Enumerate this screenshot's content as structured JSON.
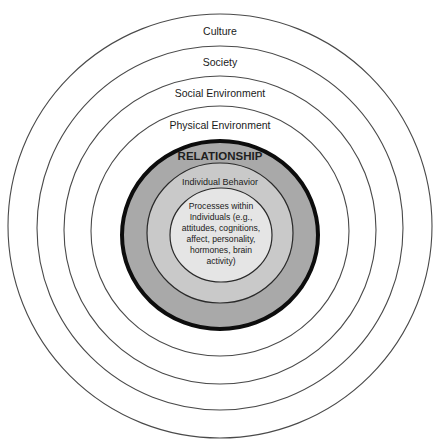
{
  "diagram": {
    "title": "",
    "type": "nested-concentric-circles",
    "layers": [
      {
        "id": "culture",
        "label": "Culture",
        "fill": "#ffffff",
        "stroke": "#4a4a4a"
      },
      {
        "id": "society",
        "label": "Society",
        "fill": "#ffffff",
        "stroke": "#4a4a4a"
      },
      {
        "id": "social_environment",
        "label": "Social Environment",
        "fill": "#ffffff",
        "stroke": "#4a4a4a"
      },
      {
        "id": "physical_environment",
        "label": "Physical Environment",
        "fill": "#ffffff",
        "stroke": "#4a4a4a"
      },
      {
        "id": "relationship",
        "label": "RELATIONSHIP",
        "fill": "#a9a9a9",
        "stroke": "#0d0d0d"
      },
      {
        "id": "individual_behavior",
        "label": "Individual Behavior",
        "fill": "#c9c9c9",
        "stroke": "#2a2a2a"
      },
      {
        "id": "processes",
        "label": "Processes within\nIndividuals (e.g.,\nattitudes, cognitions,\naffect, personality,\nhormones, brain\nactivity)",
        "fill": "#e5e5e5",
        "stroke": "#2a2a2a"
      }
    ]
  }
}
